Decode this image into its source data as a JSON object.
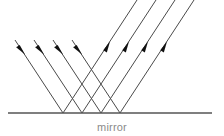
{
  "diagram": {
    "caption": "mirror",
    "colors": {
      "ray_stroke": "#4a4a4a",
      "arrow_fill": "#111111",
      "mirror_stroke": "#555555",
      "caption_text": "#8a8a8a",
      "background": "#ffffff"
    },
    "mirror": {
      "label": "mirror",
      "x1": 8,
      "x2": 212,
      "y": 113
    },
    "incident_rays": [
      {
        "name": "incident-ray-1",
        "x1": 15,
        "y1": 40,
        "x2": 63,
        "y2": 113,
        "arrow_x": 22,
        "arrow_y": 50,
        "angle_deg": 56.7
      },
      {
        "name": "incident-ray-2",
        "x1": 34,
        "y1": 40,
        "x2": 82,
        "y2": 113,
        "arrow_x": 41,
        "arrow_y": 50,
        "angle_deg": 56.7
      },
      {
        "name": "incident-ray-3",
        "x1": 53,
        "y1": 40,
        "x2": 101,
        "y2": 113,
        "arrow_x": 60,
        "arrow_y": 50,
        "angle_deg": 56.7
      },
      {
        "name": "incident-ray-4",
        "x1": 72,
        "y1": 40,
        "x2": 120,
        "y2": 113,
        "arrow_x": 79,
        "arrow_y": 50,
        "angle_deg": 56.7
      }
    ],
    "reflected_rays": [
      {
        "name": "reflected-ray-1",
        "x1": 63,
        "y1": 113,
        "x2": 137,
        "y2": 0,
        "arrow_x": 107,
        "arrow_y": 46,
        "angle_deg": 56.7
      },
      {
        "name": "reflected-ray-2",
        "x1": 82,
        "y1": 113,
        "x2": 156,
        "y2": 0,
        "arrow_x": 126,
        "arrow_y": 46,
        "angle_deg": 56.7
      },
      {
        "name": "reflected-ray-3",
        "x1": 101,
        "y1": 113,
        "x2": 175,
        "y2": 0,
        "arrow_x": 145,
        "arrow_y": 46,
        "angle_deg": 56.7
      },
      {
        "name": "reflected-ray-4",
        "x1": 120,
        "y1": 113,
        "x2": 194,
        "y2": 0,
        "arrow_x": 164,
        "arrow_y": 46,
        "angle_deg": 56.7
      }
    ],
    "contact_points": [
      63,
      82,
      101,
      120
    ]
  }
}
